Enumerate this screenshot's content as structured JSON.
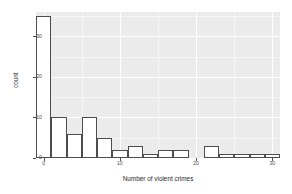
{
  "chart_data": {
    "type": "bar",
    "title": "",
    "xlabel": "Number of violent crimes",
    "ylabel": "count",
    "xlim": [
      -1,
      31
    ],
    "ylim": [
      0,
      36
    ],
    "grid": true,
    "legend": "none",
    "binwidth": 2,
    "x_ticks": [
      "0",
      "10",
      "20",
      "30"
    ],
    "x_tick_values": [
      0,
      10,
      20,
      30
    ],
    "y_ticks": [
      "0",
      "10",
      "20",
      "30"
    ],
    "y_tick_values": [
      0,
      10,
      20,
      30
    ],
    "bin_starts": [
      -1,
      1,
      3,
      5,
      7,
      9,
      11,
      13,
      15,
      17,
      19,
      21,
      23,
      25,
      27,
      29
    ],
    "bin_centers": [
      0,
      2,
      4,
      6,
      8,
      10,
      12,
      14,
      16,
      18,
      20,
      22,
      24,
      26,
      28,
      30
    ],
    "values": [
      35,
      10,
      6,
      10,
      5,
      2,
      3,
      1,
      2,
      2,
      0,
      3,
      1,
      1,
      1,
      1
    ],
    "bar_fill": "#ffffff",
    "bar_outline": "#4d4d4d",
    "panel_background": "#ebebeb",
    "gridline_color": "#ffffff"
  },
  "axes": {
    "x_title": "Number of violent crimes",
    "y_title": "count"
  }
}
